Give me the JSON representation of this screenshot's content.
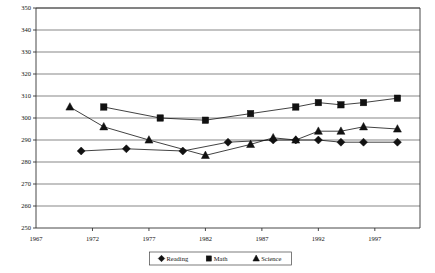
{
  "chart_data": {
    "type": "line",
    "title": "",
    "xlabel": "",
    "ylabel": "",
    "x": [
      1970,
      1971,
      1973,
      1975,
      1977,
      1980,
      1982,
      1984,
      1986,
      1988,
      1990,
      1992,
      1994,
      1996,
      1999
    ],
    "xlim": [
      1967,
      2001
    ],
    "ylim": [
      250,
      350
    ],
    "ytick_step": 10,
    "xtick_labels": [
      "1967",
      "1972",
      "1977",
      "1982",
      "1987",
      "1992",
      "1997"
    ],
    "xticks": [
      1967,
      1972,
      1977,
      1982,
      1987,
      1992,
      1997
    ],
    "ytick_labels": [
      "250",
      "260",
      "270",
      "280",
      "290",
      "300",
      "310",
      "320",
      "330",
      "340",
      "350"
    ],
    "yticks": [
      250,
      260,
      270,
      280,
      290,
      300,
      310,
      320,
      330,
      340,
      350
    ],
    "grid": true,
    "legend_position": "bottom",
    "series": [
      {
        "name": "Reading",
        "marker": "diamond",
        "color": "#111111",
        "x": [
          1971,
          1975,
          1980,
          1984,
          1988,
          1990,
          1992,
          1994,
          1996,
          1999
        ],
        "values": [
          285,
          286,
          285,
          289,
          290,
          290,
          290,
          289,
          289,
          289
        ]
      },
      {
        "name": "Math",
        "marker": "square",
        "color": "#111111",
        "x": [
          1973,
          1978,
          1982,
          1986,
          1990,
          1992,
          1994,
          1996,
          1999
        ],
        "values": [
          305,
          300,
          299,
          302,
          305,
          307,
          306,
          307,
          309
        ]
      },
      {
        "name": "Science",
        "marker": "triangle",
        "color": "#111111",
        "x": [
          1970,
          1973,
          1977,
          1982,
          1986,
          1988,
          1990,
          1992,
          1994,
          1996,
          1999
        ],
        "values": [
          305,
          296,
          290,
          283,
          288,
          291,
          290,
          294,
          294,
          296,
          295
        ]
      }
    ]
  },
  "legend": {
    "items": [
      {
        "label": "Reading",
        "marker": "diamond"
      },
      {
        "label": "Math",
        "marker": "square"
      },
      {
        "label": "Science",
        "marker": "triangle"
      }
    ]
  }
}
